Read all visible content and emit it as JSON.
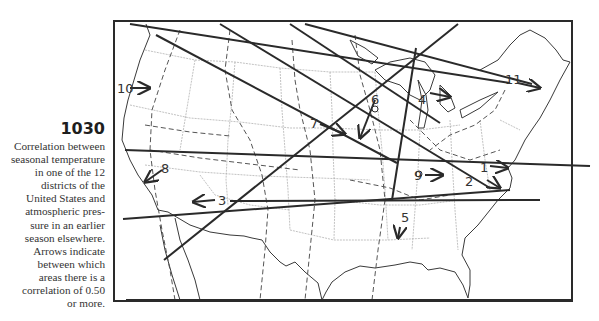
{
  "figure": {
    "number": "1030",
    "caption_lines": [
      "Correlation between",
      "seasonal temperature",
      "in one of the 12",
      "districts of the",
      "United States and",
      "atmospheric pres-",
      "sure in an earlier",
      "season elsewhere.",
      "Arrows indicate",
      "between which",
      "areas there is a",
      "correlation of 0.50",
      "or more."
    ]
  },
  "map": {
    "title": "United States correlation districts",
    "district_labels": [
      {
        "id": "1",
        "label": "1"
      },
      {
        "id": "2",
        "label": "2"
      },
      {
        "id": "3",
        "label": "3"
      },
      {
        "id": "4",
        "label": "4"
      },
      {
        "id": "5",
        "label": "5"
      },
      {
        "id": "6",
        "label": "6"
      },
      {
        "id": "7",
        "label": "7"
      },
      {
        "id": "8",
        "label": "8"
      },
      {
        "id": "9",
        "label": "9"
      },
      {
        "id": "10",
        "label": "10"
      },
      {
        "id": "11",
        "label": "11"
      }
    ],
    "colors": {
      "ink": "#2a2a2a",
      "state_lines": "#9a9a9a",
      "district_lines": "#555555"
    }
  }
}
